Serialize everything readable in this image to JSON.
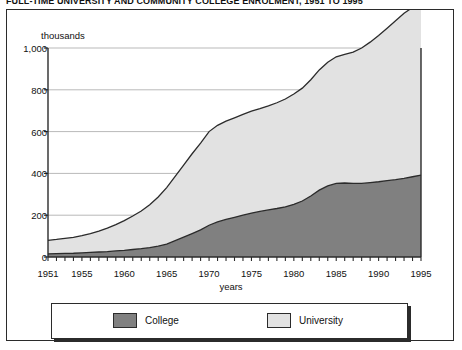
{
  "title": "FULL-TIME UNIVERSITY AND COMMUNITY COLLEGE ENROLMENT, 1951 TO 1995",
  "legend": {
    "items": [
      {
        "label": "College",
        "color": "#808080"
      },
      {
        "label": "University",
        "color": "#e2e2e2"
      }
    ]
  },
  "chart_data": {
    "type": "area",
    "stacked": true,
    "title": "FULL-TIME UNIVERSITY AND COMMUNITY COLLEGE ENROLMENT, 1951 TO 1995",
    "xlabel": "years",
    "ylabel": "thousands",
    "yunit_label": "thousands",
    "xlim": [
      1951,
      1995
    ],
    "ylim": [
      0,
      1000
    ],
    "yticks": [
      0,
      200,
      400,
      600,
      800,
      1000
    ],
    "ytick_labels": [
      "0",
      "200",
      "400",
      "600",
      "800",
      "1,000"
    ],
    "xticks": [
      1951,
      1955,
      1960,
      1965,
      1970,
      1975,
      1980,
      1985,
      1990,
      1995
    ],
    "xtick_labels": [
      "1951",
      "1955",
      "1960",
      "1965",
      "1970",
      "1975",
      "1980",
      "1985",
      "1990",
      "1995"
    ],
    "minor_xtick_interval": 1,
    "grid": "horizontal",
    "legend_position": "bottom",
    "x": [
      1951,
      1952,
      1953,
      1954,
      1955,
      1956,
      1957,
      1958,
      1959,
      1960,
      1961,
      1962,
      1963,
      1964,
      1965,
      1966,
      1967,
      1968,
      1969,
      1970,
      1971,
      1972,
      1973,
      1974,
      1975,
      1976,
      1977,
      1978,
      1979,
      1980,
      1981,
      1982,
      1983,
      1984,
      1985,
      1986,
      1987,
      1988,
      1989,
      1990,
      1991,
      1992,
      1993,
      1994,
      1995
    ],
    "series": [
      {
        "name": "College",
        "color": "#808080",
        "values": [
          15,
          16,
          17,
          18,
          20,
          22,
          24,
          26,
          29,
          32,
          36,
          40,
          45,
          52,
          62,
          78,
          95,
          112,
          130,
          152,
          168,
          180,
          190,
          200,
          210,
          218,
          225,
          232,
          240,
          252,
          268,
          292,
          320,
          340,
          352,
          354,
          352,
          352,
          356,
          360,
          365,
          370,
          376,
          384,
          392
        ]
      },
      {
        "name": "University",
        "color": "#e2e2e2",
        "values": [
          65,
          68,
          72,
          76,
          82,
          90,
          100,
          112,
          126,
          142,
          160,
          180,
          205,
          235,
          270,
          308,
          345,
          382,
          415,
          448,
          462,
          470,
          476,
          482,
          488,
          492,
          498,
          506,
          516,
          528,
          540,
          556,
          575,
          592,
          606,
          616,
          628,
          648,
          672,
          700,
          730,
          760,
          790,
          810,
          822
        ]
      }
    ],
    "total": [
      80,
      84,
      89,
      94,
      102,
      112,
      124,
      138,
      155,
      174,
      196,
      220,
      250,
      287,
      332,
      386,
      440,
      494,
      545,
      600,
      630,
      650,
      666,
      682,
      698,
      710,
      723,
      738,
      756,
      780,
      808,
      848,
      895,
      932,
      958,
      970,
      980,
      1000,
      1028,
      1060,
      1095,
      1130,
      1166,
      1194,
      1214
    ]
  }
}
